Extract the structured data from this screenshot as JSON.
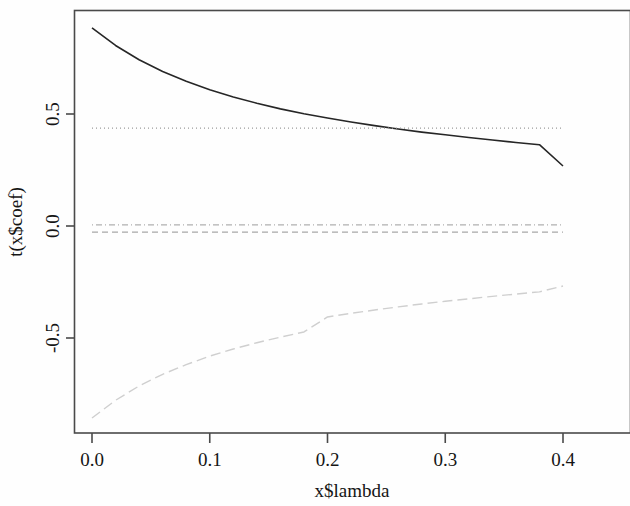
{
  "chart_data": {
    "type": "line",
    "title": "",
    "subtitle": "",
    "xlabel": "x$lambda",
    "ylabel": "t(x$coef)",
    "xlim": [
      0.0,
      0.4
    ],
    "ylim": [
      -0.88,
      0.92
    ],
    "xticks": [
      "0.0",
      "0.1",
      "0.2",
      "0.3",
      "0.4"
    ],
    "xtick_values": [
      0.0,
      0.1,
      0.2,
      0.3,
      0.4
    ],
    "yticks": [
      "0.5",
      "0.0",
      "-0.5"
    ],
    "ytick_values": [
      0.5,
      0.0,
      -0.5
    ],
    "grid": false,
    "legend": "none",
    "frame": true,
    "x": [
      0.0,
      0.02,
      0.04,
      0.06,
      0.08,
      0.1,
      0.12,
      0.14,
      0.16,
      0.18,
      0.2,
      0.22,
      0.24,
      0.26,
      0.28,
      0.3,
      0.32,
      0.34,
      0.36,
      0.38,
      0.4
    ],
    "series": [
      {
        "name": "coef-1",
        "style": "solid",
        "color": "#262626",
        "width": 1.6,
        "values": [
          0.884,
          0.806,
          0.742,
          0.69,
          0.646,
          0.608,
          0.576,
          0.548,
          0.523,
          0.501,
          0.482,
          0.464,
          0.448,
          0.433,
          0.419,
          0.407,
          0.395,
          0.384,
          0.373,
          0.363,
          0.268
        ]
      },
      {
        "name": "coef-2",
        "style": "dotted",
        "color": "#9b9b9b",
        "width": 1.3,
        "values": [
          0.437,
          0.437,
          0.437,
          0.437,
          0.437,
          0.437,
          0.437,
          0.437,
          0.437,
          0.437,
          0.437,
          0.437,
          0.437,
          0.437,
          0.437,
          0.437,
          0.437,
          0.437,
          0.437,
          0.437,
          0.437
        ]
      },
      {
        "name": "coef-3",
        "style": "dotdash",
        "color": "#b0b0b0",
        "width": 1.3,
        "values": [
          0.005,
          0.005,
          0.005,
          0.005,
          0.005,
          0.005,
          0.005,
          0.005,
          0.005,
          0.005,
          0.005,
          0.005,
          0.005,
          0.005,
          0.005,
          0.005,
          0.005,
          0.005,
          0.005,
          0.005,
          0.005
        ]
      },
      {
        "name": "coef-4",
        "style": "dashed",
        "color": "#a8a8a8",
        "width": 1.3,
        "values": [
          -0.027,
          -0.027,
          -0.027,
          -0.027,
          -0.027,
          -0.027,
          -0.027,
          -0.027,
          -0.027,
          -0.027,
          -0.027,
          -0.027,
          -0.027,
          -0.027,
          -0.027,
          -0.027,
          -0.027,
          -0.027,
          -0.027,
          -0.027,
          -0.027
        ]
      },
      {
        "name": "coef-5",
        "style": "longdash",
        "color": "#cfcfcf",
        "width": 1.4,
        "values": [
          -0.857,
          -0.778,
          -0.714,
          -0.662,
          -0.619,
          -0.581,
          -0.549,
          -0.521,
          -0.496,
          -0.473,
          -0.406,
          -0.39,
          -0.375,
          -0.361,
          -0.348,
          -0.336,
          -0.325,
          -0.314,
          -0.304,
          -0.294,
          -0.268
        ]
      }
    ]
  },
  "plot": {
    "frame_color": "#4a4a4a",
    "background": "#ffffff",
    "axis_label_color": "#151515"
  }
}
